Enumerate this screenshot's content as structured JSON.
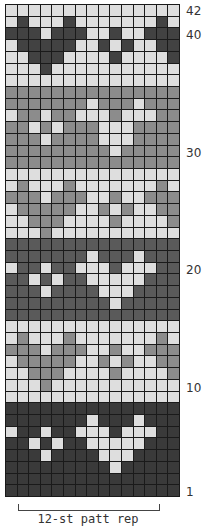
{
  "chart": {
    "columns": 15,
    "rows": 42,
    "colors": {
      "L": "#dedede",
      "M": "#8c8c8c",
      "D": "#5a5a5a",
      "K": "#3a3a3a",
      "T": "#424242"
    },
    "row_labels": [
      {
        "label": "42",
        "row": 42
      },
      {
        "label": "40",
        "row": 40
      },
      {
        "label": "30",
        "row": 30
      },
      {
        "label": "20",
        "row": 20
      },
      {
        "label": "10",
        "row": 10
      },
      {
        "label": "1",
        "row": 1
      }
    ],
    "repeat_label": "12-st patt rep",
    "grid_top_to_bottom": [
      "LLLLLLLLLLLLLLL",
      "LTLLLTLLLLLLLTL",
      "TTTLTTTLLTLLTTT",
      "LTTTTTLLTLTLLTT",
      "LLTTTLLLLTLLLLT",
      "LLLTLLLLLLLLLLL",
      "LLLLLLLLLLLLLLL",
      "MMMMMMMMMMMMMMM",
      "MMMMMMMLMMMLMMM",
      "LMMLMMLLLMLLLMM",
      "MMLMLMMMLLLMMMM",
      "MMMLMMMMLLLMMMM",
      "MMMMMMMMMLMMMMM",
      "MMMMMMMMMMMMMMM",
      "LLLLLLLLLLLLLLL",
      "LMLLLMLLLLLLLML",
      "MMMLMMMLLMLLMMM",
      "LMMMMMLLMLMLLMM",
      "LLMMMLLLLMLLLLM",
      "LLLMLLLLLLLLLLL",
      "DDDDDDDDDDDDDDD",
      "DDDDDDDLDDDLDDD",
      "LDDLDDLLLDLLLDD",
      "DDLDLDDLLLLLDDD",
      "DDDLDDDDLLLDDDD",
      "DDDDDDDDDLDDDDD",
      "DDDDDDDDDDDDDDD",
      "LLLLLLLLLLLLLLL",
      "LMLLLMLLLLLLLML",
      "MMMLMMMLLMLLMMM",
      "LMMMMMLLMLMLLMM",
      "LLMMMLLLLMLLLLM",
      "LLLMLLLLLLLLLLL",
      "LLLLLLLLLLLLLLL",
      "KKKKKKKKKKKKKKK",
      "KKKKKKKLKKKLKKK",
      "LKKLKKLLLKLLLKK",
      "KKLKLKKLLLLLKKK",
      "KKKLKKKKLLLKKKK",
      "KKKKKKKKKLKKKKK",
      "KKKKKKKKKKKKKKK",
      "KKKKKKKKKKKKKKK"
    ]
  }
}
